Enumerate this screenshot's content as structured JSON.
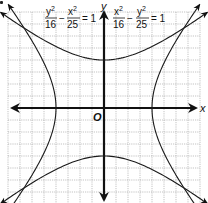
{
  "chart_data": {
    "type": "line",
    "title": "",
    "xlabel": "x",
    "ylabel": "y",
    "origin_label": "O",
    "xlim": [
      -8,
      8
    ],
    "ylim": [
      -8,
      8
    ],
    "grid": true,
    "grid_step": 1,
    "series": [
      {
        "name": "y^2/16 - x^2/25 = 1",
        "kind": "hyperbola-vertical",
        "a": 4,
        "b": 5,
        "vertices": [
          [
            0,
            4
          ],
          [
            0,
            -4
          ]
        ],
        "label_num1": "y",
        "label_den1": "16",
        "label_num2": "x",
        "label_den2": "25",
        "label_rhs": "= 1"
      },
      {
        "name": "x^2/16 - y^2/25 = 1",
        "kind": "hyperbola-horizontal",
        "a": 4,
        "b": 5,
        "vertices": [
          [
            4,
            0
          ],
          [
            -4,
            0
          ]
        ],
        "label_num1": "x",
        "label_den1": "16",
        "label_num2": "y",
        "label_den2": "25",
        "label_rhs": "= 1"
      }
    ]
  },
  "labels": {
    "x_axis": "x",
    "y_axis": "y",
    "origin": "O",
    "eq1": {
      "num1": "y",
      "den1": "16",
      "minus": "−",
      "num2": "x",
      "den2": "25",
      "rhs": "= 1",
      "sup": "2"
    },
    "eq2": {
      "num1": "x",
      "den1": "16",
      "minus": "−",
      "num2": "y",
      "den2": "25",
      "rhs": "= 1",
      "sup": "2"
    }
  }
}
